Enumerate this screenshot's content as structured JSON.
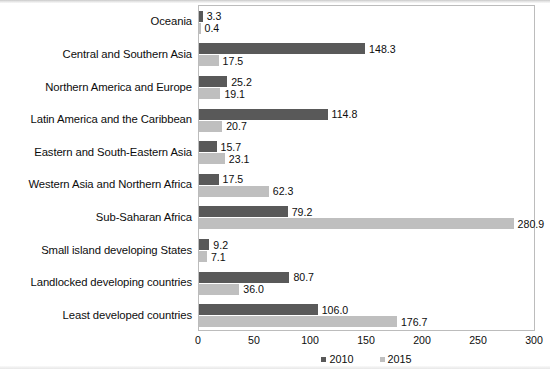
{
  "chart_data": {
    "type": "bar",
    "orientation": "horizontal",
    "title": "",
    "xlabel": "",
    "ylabel": "",
    "xlim": [
      0,
      300
    ],
    "xticks": [
      0,
      50,
      100,
      150,
      200,
      250,
      300
    ],
    "grid": false,
    "legend_position": "bottom-center",
    "categories": [
      "Oceania",
      "Central and Southern Asia",
      "Northern America and Europe",
      "Latin America and the Caribbean",
      "Eastern and South-Eastern Asia",
      "Western Asia and Northern Africa",
      "Sub-Saharan Africa",
      "Small island developing States",
      "Landlocked developing countries",
      "Least developed countries"
    ],
    "series": [
      {
        "name": "2010",
        "color": "#595959",
        "values": [
          3.3,
          148.3,
          25.2,
          114.8,
          15.7,
          17.5,
          79.2,
          9.2,
          80.7,
          106.0
        ],
        "labels": [
          "3.3",
          "148.3",
          "25.2",
          "114.8",
          "15.7",
          "17.5",
          "79.2",
          "9.2",
          "80.7",
          "106.0"
        ]
      },
      {
        "name": "2015",
        "color": "#bfbfbf",
        "values": [
          0.4,
          17.5,
          19.1,
          20.7,
          23.1,
          62.3,
          280.9,
          7.1,
          36.0,
          176.7
        ],
        "labels": [
          "0.4",
          "17.5",
          "19.1",
          "20.7",
          "23.1",
          "62.3",
          "280.9",
          "7.1",
          "36.0",
          "176.7"
        ]
      }
    ]
  },
  "legend": {
    "items": [
      {
        "label": "2010",
        "swatch": "series-2010-swatch"
      },
      {
        "label": "2015",
        "swatch": "series-2015-swatch"
      }
    ]
  }
}
